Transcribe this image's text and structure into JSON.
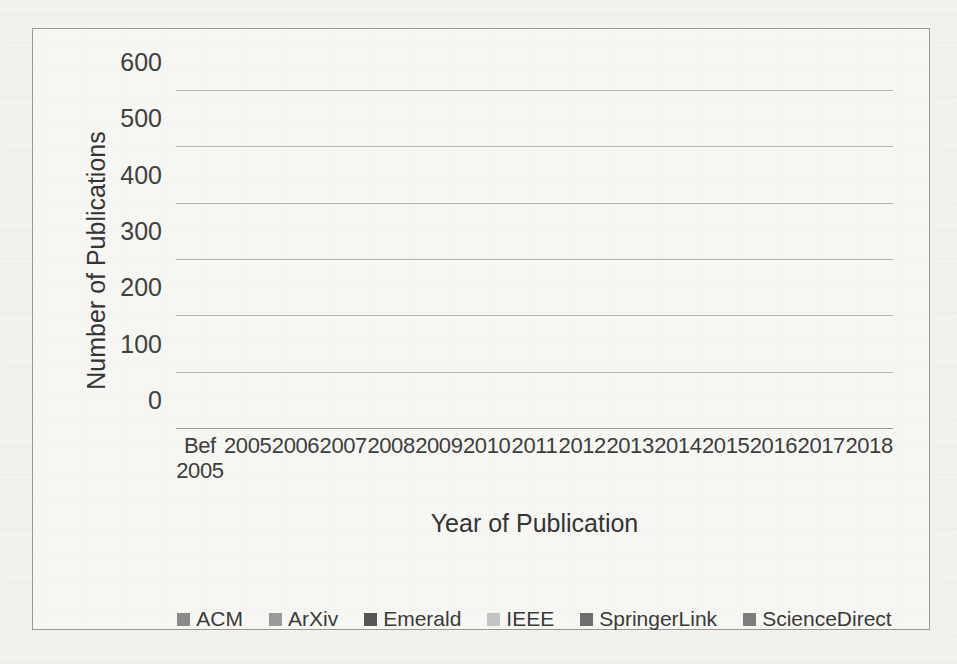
{
  "chart_data": {
    "type": "bar",
    "subtype": "stacked-vertical",
    "title": "",
    "xlabel": "Year of Publication",
    "ylabel": "Number of Publications",
    "ylim": [
      0,
      600
    ],
    "yticks": [
      0,
      100,
      200,
      300,
      400,
      500,
      600
    ],
    "grid": true,
    "legend_position": "bottom",
    "categories": [
      "Bef 2005",
      "2005",
      "2006",
      "2007",
      "2008",
      "2009",
      "2010",
      "2011",
      "2012",
      "2013",
      "2014",
      "2015",
      "2016",
      "2017",
      "2018"
    ],
    "category_lines": [
      [
        "Bef",
        "2005"
      ],
      [
        "2005"
      ],
      [
        "2006"
      ],
      [
        "2007"
      ],
      [
        "2008"
      ],
      [
        "2009"
      ],
      [
        "2010"
      ],
      [
        "2011"
      ],
      [
        "2012"
      ],
      [
        "2013"
      ],
      [
        "2014"
      ],
      [
        "2015"
      ],
      [
        "2016"
      ],
      [
        "2017"
      ],
      [
        "2018"
      ]
    ],
    "series": [
      {
        "name": "ACM",
        "color": "#8a8a8a",
        "values": [
          135,
          22,
          17,
          27,
          25,
          29,
          22,
          38,
          42,
          40,
          57,
          52,
          52,
          55,
          25
        ]
      },
      {
        "name": "ArXiv",
        "color": "#9a9a9a",
        "values": [
          0,
          0,
          0,
          0,
          0,
          0,
          0,
          0,
          0,
          0,
          0,
          0,
          0,
          0,
          0
        ]
      },
      {
        "name": "Emerald",
        "color": "#565656",
        "values": [
          30,
          5,
          4,
          6,
          7,
          8,
          5,
          10,
          18,
          15,
          28,
          17,
          22,
          70,
          0
        ]
      },
      {
        "name": "IEEE",
        "color": "#c4c4c4",
        "values": [
          0,
          4,
          4,
          7,
          8,
          9,
          8,
          10,
          22,
          30,
          52,
          92,
          127,
          125,
          0
        ]
      },
      {
        "name": "SpringerLink",
        "color": "#6e6e6e",
        "values": [
          120,
          9,
          11,
          19,
          20,
          23,
          23,
          39,
          62,
          83,
          167,
          215,
          283,
          358,
          145
        ]
      },
      {
        "name": "ScienceDirect",
        "color": "#7d7d7d",
        "values": [
          0,
          0,
          0,
          0,
          0,
          0,
          0,
          0,
          0,
          0,
          0,
          0,
          0,
          0,
          0
        ]
      }
    ],
    "totals": [
      285,
      40,
      36,
      59,
      60,
      69,
      58,
      97,
      144,
      168,
      304,
      376,
      484,
      608,
      170
    ]
  },
  "legend": {
    "items": [
      {
        "label": "ACM",
        "color": "#8a8a8a"
      },
      {
        "label": "ArXiv",
        "color": "#9a9a9a"
      },
      {
        "label": "Emerald",
        "color": "#565656"
      },
      {
        "label": "IEEE",
        "color": "#c4c4c4"
      },
      {
        "label": "SpringerLink",
        "color": "#6e6e6e"
      },
      {
        "label": "ScienceDirect",
        "color": "#7d7d7d"
      }
    ]
  }
}
